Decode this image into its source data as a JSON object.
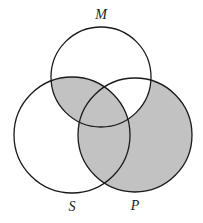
{
  "figure": {
    "kind": "venn-diagram",
    "set_count": 3,
    "width": 203,
    "height": 223,
    "background_color": "#ffffff"
  },
  "colors": {
    "shaded_fill": "#c2c2c2",
    "unshaded_fill": "#ffffff",
    "stroke": "#1a1a1a",
    "label_color": "#1a1a1a"
  },
  "labels": {
    "middle_term": "M",
    "subject_term": "S",
    "predicate_term": "P"
  },
  "circles": {
    "M": {
      "label": "M",
      "cx": 101,
      "cy": 77,
      "r": 50
    },
    "S": {
      "label": "S",
      "cx": 72,
      "cy": 135,
      "r": 58
    },
    "P": {
      "label": "P",
      "cx": 135,
      "cy": 135,
      "r": 57
    }
  },
  "regions": [
    {
      "name": "M-only",
      "sets": [
        "M"
      ],
      "shaded": false
    },
    {
      "name": "S-only",
      "sets": [
        "S"
      ],
      "shaded": false
    },
    {
      "name": "P-only",
      "sets": [
        "P"
      ],
      "shaded": true
    },
    {
      "name": "S-and-M",
      "sets": [
        "S",
        "M"
      ],
      "shaded": true
    },
    {
      "name": "M-and-P",
      "sets": [
        "M",
        "P"
      ],
      "shaded": false
    },
    {
      "name": "S-and-P",
      "sets": [
        "S",
        "P"
      ],
      "shaded": true
    },
    {
      "name": "S-and-M-and-P",
      "sets": [
        "S",
        "M",
        "P"
      ],
      "shaded": true
    }
  ],
  "stroke_width": 1.3
}
